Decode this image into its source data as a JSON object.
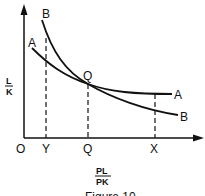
{
  "diagram": {
    "type": "economics-curve-diagram",
    "y_axis": {
      "numerator": "L",
      "denominator": "K"
    },
    "x_axis": {
      "numerator": "PL",
      "denominator": "PK"
    },
    "origin_label": "O",
    "x_ticks": [
      "Y",
      "Q",
      "X"
    ],
    "curves": [
      {
        "name": "A",
        "start_label": "A",
        "end_label": "A"
      },
      {
        "name": "B",
        "start_label": "B",
        "end_label": "B"
      }
    ],
    "intersection_label": "Q",
    "caption": "Figure 10"
  }
}
